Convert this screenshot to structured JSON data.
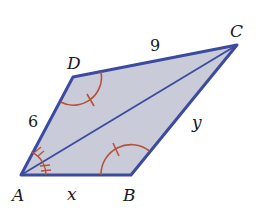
{
  "figure": {
    "type": "quadrilateral-with-diagonal",
    "colors": {
      "fill": "#c9ccd8",
      "edge": "#3c4aa0",
      "angle_mark": "#b5523a",
      "text": "#1a1a1a"
    },
    "vertices": {
      "A": {
        "label": "A"
      },
      "B": {
        "label": "B"
      },
      "C": {
        "label": "C"
      },
      "D": {
        "label": "D"
      }
    },
    "sides": {
      "AD": {
        "label": "6"
      },
      "DC": {
        "label": "9"
      },
      "AB": {
        "label": "x"
      },
      "BC": {
        "label": "y"
      }
    },
    "diagonal": "AC",
    "angle_marks": [
      {
        "vertex": "D",
        "ticks": 1
      },
      {
        "vertex": "B",
        "ticks": 1
      },
      {
        "vertex": "A",
        "part": "DAC",
        "ticks": 2
      },
      {
        "vertex": "A",
        "part": "CAB",
        "ticks": 2
      }
    ]
  }
}
